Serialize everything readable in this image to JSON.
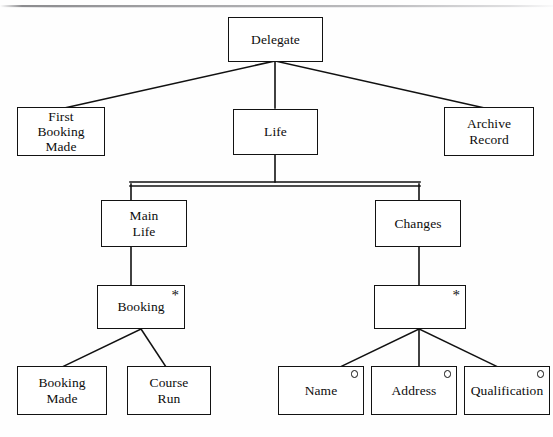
{
  "diagram": {
    "title": "Delegate",
    "type": "jackson-structure-diagram",
    "marker_glyphs": {
      "iteration": "*",
      "selection": "o"
    },
    "nodes": [
      {
        "id": "delegate",
        "label": "Delegate",
        "marker": "none",
        "level": 1
      },
      {
        "id": "first-booking-made",
        "label": "First\nBooking\nMade",
        "marker": "none",
        "level": 2
      },
      {
        "id": "life",
        "label": "Life",
        "marker": "none",
        "level": 2
      },
      {
        "id": "archive-record",
        "label": "Archive\nRecord",
        "marker": "none",
        "level": 2
      },
      {
        "id": "main-life",
        "label": "Main\nLife",
        "marker": "none",
        "level": 3
      },
      {
        "id": "changes",
        "label": "Changes",
        "marker": "none",
        "level": 3
      },
      {
        "id": "booking",
        "label": "Booking",
        "marker": "iteration",
        "level": 4
      },
      {
        "id": "change-item",
        "label": "",
        "marker": "iteration",
        "level": 4
      },
      {
        "id": "booking-made",
        "label": "Booking\nMade",
        "marker": "none",
        "level": 5
      },
      {
        "id": "course-run",
        "label": "Course\nRun",
        "marker": "none",
        "level": 5
      },
      {
        "id": "name",
        "label": "Name",
        "marker": "selection",
        "level": 5
      },
      {
        "id": "address",
        "label": "Address",
        "marker": "selection",
        "level": 5
      },
      {
        "id": "qualification",
        "label": "Qualification",
        "marker": "selection",
        "level": 5
      }
    ],
    "edges": [
      {
        "from": "delegate",
        "to": "first-booking-made"
      },
      {
        "from": "delegate",
        "to": "life"
      },
      {
        "from": "delegate",
        "to": "archive-record"
      },
      {
        "from": "life",
        "to": "main-life"
      },
      {
        "from": "life",
        "to": "changes"
      },
      {
        "from": "main-life",
        "to": "booking"
      },
      {
        "from": "changes",
        "to": "change-item"
      },
      {
        "from": "booking",
        "to": "booking-made"
      },
      {
        "from": "booking",
        "to": "course-run"
      },
      {
        "from": "change-item",
        "to": "name"
      },
      {
        "from": "change-item",
        "to": "address"
      },
      {
        "from": "change-item",
        "to": "qualification"
      }
    ],
    "colors": {
      "box_stroke": "#121212",
      "edge_stroke": "#111111",
      "background": "#fefefe",
      "text": "#0d0d0d"
    }
  }
}
